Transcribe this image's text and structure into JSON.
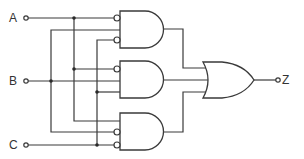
{
  "diagram": {
    "type": "logic-circuit",
    "inputs": [
      {
        "label": "A",
        "y": 18
      },
      {
        "label": "B",
        "y": 81
      },
      {
        "label": "C",
        "y": 145
      }
    ],
    "output": {
      "label": "Z"
    },
    "gates": [
      {
        "id": "and1",
        "type": "AND",
        "inputs": [
          "NOT A",
          "B",
          "NOT C"
        ]
      },
      {
        "id": "and2",
        "type": "AND",
        "inputs": [
          "NOT A",
          "B",
          "C"
        ]
      },
      {
        "id": "and3",
        "type": "AND",
        "inputs": [
          "A",
          "NOT B",
          "NOT C"
        ]
      },
      {
        "id": "or1",
        "type": "OR",
        "inputs": [
          "and1",
          "and2",
          "and3"
        ],
        "output": "Z"
      }
    ],
    "colors": {
      "line": "#3a3a3a",
      "background": "#ffffff"
    }
  }
}
